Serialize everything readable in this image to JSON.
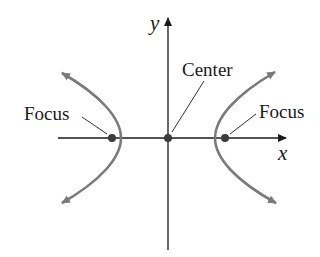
{
  "diagram": {
    "axes": {
      "x_label": "x",
      "y_label": "y"
    },
    "labels": {
      "center": "Center",
      "focus_left": "Focus",
      "focus_right": "Focus"
    },
    "colors": {
      "axis": "#1a1a1a",
      "curve": "#7a7a7a",
      "point": "#3c3c3c",
      "leader": "#333333",
      "text": "#1a1a1a"
    }
  }
}
